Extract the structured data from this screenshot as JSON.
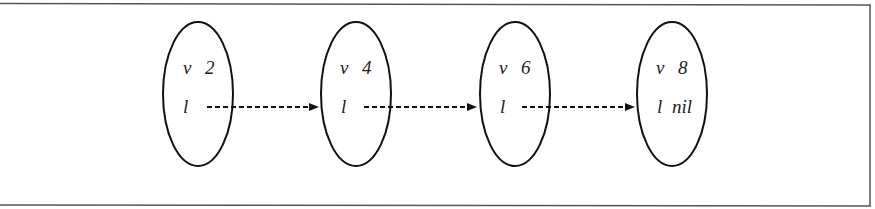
{
  "diagram": {
    "type": "linked-list",
    "nodes": [
      {
        "id": "n1",
        "value_label": "v",
        "value": "2",
        "link_label": "l",
        "link_target": "n2"
      },
      {
        "id": "n2",
        "value_label": "v",
        "value": "4",
        "link_label": "l",
        "link_target": "n3"
      },
      {
        "id": "n3",
        "value_label": "v",
        "value": "6",
        "link_label": "l",
        "link_target": "n4"
      },
      {
        "id": "n4",
        "value_label": "v",
        "value": "8",
        "link_label": "l",
        "link_target": null,
        "nil_label": "nil"
      }
    ],
    "edges": [
      {
        "from": "n1",
        "to": "n2",
        "style": "dashed-arrow"
      },
      {
        "from": "n2",
        "to": "n3",
        "style": "dashed-arrow"
      },
      {
        "from": "n3",
        "to": "n4",
        "style": "dashed-arrow"
      }
    ],
    "colors": {
      "stroke": "#111111",
      "frame": "#555555",
      "background": "#ffffff"
    }
  }
}
